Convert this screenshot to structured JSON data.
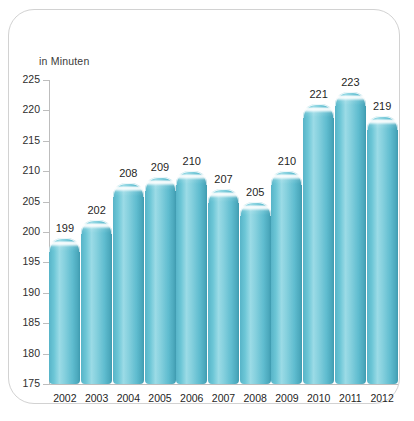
{
  "chart_data": {
    "type": "bar",
    "title": "",
    "subtitle": "",
    "xlabel": "",
    "ylabel": "in Minuten",
    "unit_label": "in Minuten",
    "categories": [
      "2002",
      "2003",
      "2004",
      "2005",
      "2006",
      "2007",
      "2008",
      "2009",
      "2010",
      "2011",
      "2012"
    ],
    "values": [
      199,
      202,
      208,
      209,
      210,
      207,
      205,
      210,
      221,
      223,
      219
    ],
    "ylim": [
      175,
      225
    ],
    "y_ticks": [
      225,
      220,
      215,
      210,
      205,
      200,
      195,
      190,
      185,
      180,
      175
    ],
    "y_tick_labels": [
      "225",
      "220",
      "215",
      "210",
      "205",
      "200",
      "195",
      "190",
      "185",
      "180",
      "175"
    ],
    "data_labels": [
      "199",
      "202",
      "208",
      "209",
      "210",
      "207",
      "205",
      "210",
      "221",
      "223",
      "219"
    ],
    "grid": false,
    "legend": false,
    "legend_position": "none",
    "bar_color": "#6cc6d6",
    "bar_color_dark": "#3f9bb0",
    "bar_color_light": "#9bdbe6",
    "axis_color": "#bdbdbd",
    "text_color": "#1f1f1f",
    "card_border_color": "#d2d2d2",
    "background_color": "#ffffff"
  }
}
